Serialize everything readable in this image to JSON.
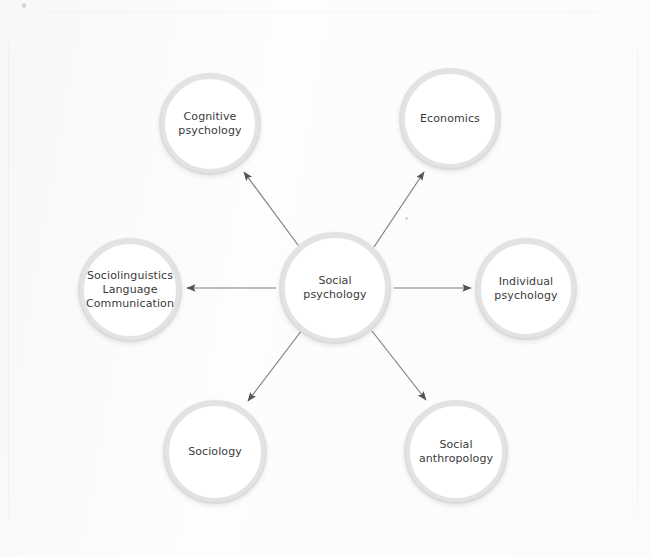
{
  "diagram": {
    "type": "radial concept map",
    "background_color": "#fefefe",
    "ring_color": "#e3e3e3",
    "text_color": "#3b3b3b",
    "arrow_color": "#7c7c7c",
    "arrowhead_color": "#5a5a5a"
  },
  "center_node": {
    "id": "social-psychology",
    "label": "Social\npsychology",
    "lines": [
      "Social",
      "psychology"
    ],
    "cx": 335,
    "cy": 288,
    "r": 56
  },
  "nodes": [
    {
      "id": "cognitive-psychology",
      "label": "Cognitive\npsychology",
      "lines": [
        "Cognitive",
        "psychology"
      ],
      "cx": 210,
      "cy": 124,
      "r": 51
    },
    {
      "id": "economics",
      "label": "Economics",
      "lines": [
        "Economics"
      ],
      "cx": 450,
      "cy": 119,
      "r": 51
    },
    {
      "id": "sociolinguistics",
      "label": "Sociolinguistics\nLanguage\nCommunication",
      "lines": [
        "Sociolinguistics",
        "Language",
        "Communication"
      ],
      "cx": 130,
      "cy": 290,
      "r": 52
    },
    {
      "id": "individual-psychology",
      "label": "Individual\npsychology",
      "lines": [
        "Individual",
        "psychology"
      ],
      "cx": 526,
      "cy": 289,
      "r": 51
    },
    {
      "id": "sociology",
      "label": "Sociology",
      "lines": [
        "Sociology"
      ],
      "cx": 215,
      "cy": 452,
      "r": 52
    },
    {
      "id": "social-anthropology",
      "label": "Social\nanthropology",
      "lines": [
        "Social",
        "anthropology"
      ],
      "cx": 456,
      "cy": 452,
      "r": 52
    }
  ],
  "edges": [
    {
      "id": "edge-to-cognitive-psychology",
      "from": "social-psychology",
      "to": "cognitive-psychology",
      "x1": 301,
      "y1": 249,
      "x2": 244,
      "y2": 172,
      "direction": "up-left"
    },
    {
      "id": "edge-to-economics",
      "from": "social-psychology",
      "to": "economics",
      "x1": 374,
      "y1": 247,
      "x2": 424,
      "y2": 172,
      "direction": "up-right"
    },
    {
      "id": "edge-to-sociolinguistics",
      "from": "social-psychology",
      "to": "sociolinguistics",
      "x1": 276,
      "y1": 288,
      "x2": 187,
      "y2": 288,
      "direction": "left"
    },
    {
      "id": "edge-to-individual-psychology",
      "from": "social-psychology",
      "to": "individual-psychology",
      "x1": 394,
      "y1": 288,
      "x2": 471,
      "y2": 288,
      "direction": "right"
    },
    {
      "id": "edge-to-sociology",
      "from": "social-psychology",
      "to": "sociology",
      "x1": 302,
      "y1": 330,
      "x2": 248,
      "y2": 401,
      "direction": "down-left"
    },
    {
      "id": "edge-to-social-anthropology",
      "from": "social-psychology",
      "to": "social-anthropology",
      "x1": 372,
      "y1": 331,
      "x2": 426,
      "y2": 400,
      "direction": "down-right"
    }
  ],
  "artifacts": [
    {
      "id": "speck-top-left",
      "x": 22,
      "y": 3,
      "w": 4,
      "h": 5
    },
    {
      "id": "speck-center-right",
      "x": 405,
      "y": 217,
      "w": 3,
      "h": 3
    }
  ]
}
